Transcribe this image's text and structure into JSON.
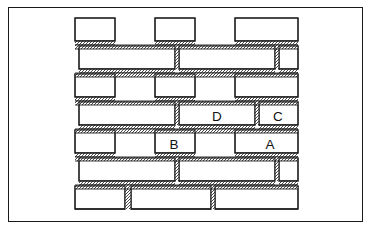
{
  "figure": {
    "kind": "masonry-bond-diagram",
    "title": "",
    "background_color": "#ffffff",
    "line_color": "#1a1a1a",
    "mortar_color": "#4a4a4a",
    "frame": {
      "x": 8,
      "y": 7,
      "width": 355,
      "height": 215,
      "border_width": 1.6
    }
  },
  "labels": [
    {
      "text": "D",
      "x": 217,
      "y": 117
    },
    {
      "text": "C",
      "x": 278,
      "y": 117
    },
    {
      "text": "B",
      "x": 174,
      "y": 145
    },
    {
      "text": "A",
      "x": 270,
      "y": 145
    }
  ],
  "wall": {
    "left": 75,
    "right": 298,
    "bed_joints_y": [
      45,
      73,
      101,
      129,
      157,
      185
    ],
    "courses": [
      {
        "index": 0,
        "name": "top-partial-course",
        "y": 18,
        "height": 27,
        "bricks": [
          {
            "x": 75,
            "width": 40,
            "type": "header",
            "open_left": true,
            "open_bottom": false
          },
          {
            "x": 155,
            "width": 40,
            "type": "header"
          },
          {
            "x": 235,
            "width": 63,
            "type": "stretcher"
          }
        ]
      },
      {
        "index": 1,
        "name": "stretcher-course",
        "y": 46,
        "height": 27,
        "bricks": [
          {
            "x": 79,
            "width": 96,
            "type": "stretcher"
          },
          {
            "x": 179,
            "width": 96,
            "type": "stretcher"
          },
          {
            "x": 279,
            "width": 19,
            "type": "part"
          }
        ]
      },
      {
        "index": 2,
        "name": "header-course",
        "y": 74,
        "height": 27,
        "bricks": [
          {
            "x": 75,
            "width": 40,
            "type": "header",
            "open_left": true
          },
          {
            "x": 155,
            "width": 40,
            "type": "header"
          },
          {
            "x": 235,
            "width": 63,
            "type": "stretcher"
          }
        ]
      },
      {
        "index": 3,
        "name": "labelled-course-DC",
        "y": 102,
        "height": 27,
        "bricks": [
          {
            "x": 79,
            "width": 96,
            "type": "stretcher",
            "label": ""
          },
          {
            "x": 179,
            "width": 76,
            "type": "stretcher",
            "label": "D"
          },
          {
            "x": 259,
            "width": 39,
            "type": "header",
            "label": "C"
          }
        ]
      },
      {
        "index": 4,
        "name": "labelled-course-BA",
        "y": 130,
        "height": 27,
        "bricks": [
          {
            "x": 75,
            "width": 40,
            "type": "header",
            "open_left": true
          },
          {
            "x": 155,
            "width": 40,
            "type": "header",
            "label": "B"
          },
          {
            "x": 235,
            "width": 63,
            "type": "stretcher",
            "label": "A"
          }
        ]
      },
      {
        "index": 5,
        "name": "stretcher-course-lower",
        "y": 158,
        "height": 27,
        "bricks": [
          {
            "x": 79,
            "width": 96,
            "type": "stretcher"
          },
          {
            "x": 179,
            "width": 96,
            "type": "stretcher"
          },
          {
            "x": 279,
            "width": 19,
            "type": "part"
          }
        ]
      },
      {
        "index": 6,
        "name": "bottom-partial-course",
        "y": 186,
        "height": 27,
        "bricks": [
          {
            "x": 75,
            "width": 50,
            "type": "part",
            "open_left": true,
            "open_bottom": true
          },
          {
            "x": 131,
            "width": 80,
            "type": "stretcher",
            "open_bottom": true
          },
          {
            "x": 215,
            "width": 83,
            "type": "stretcher",
            "open_bottom": true
          }
        ]
      }
    ]
  }
}
